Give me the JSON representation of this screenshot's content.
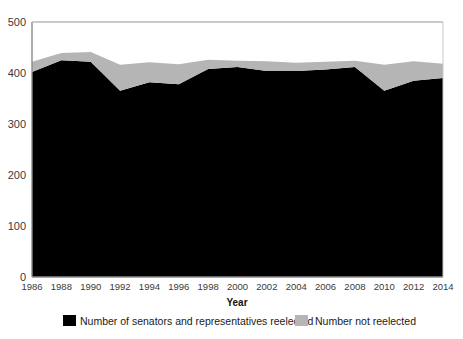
{
  "chart_data": {
    "type": "area",
    "stacked": true,
    "title": "",
    "xlabel": "Year",
    "ylabel": "",
    "categories": [
      1986,
      1988,
      1990,
      1992,
      1994,
      1996,
      1998,
      2000,
      2002,
      2004,
      2006,
      2008,
      2010,
      2012,
      2014
    ],
    "x": [
      1986,
      1988,
      1990,
      1992,
      1994,
      1996,
      1998,
      2000,
      2002,
      2004,
      2006,
      2008,
      2010,
      2012,
      2014
    ],
    "series": [
      {
        "name": "Number of senators and representatives reelected",
        "color": "#000000",
        "values": [
          402,
          425,
          422,
          365,
          382,
          378,
          408,
          412,
          404,
          404,
          407,
          412,
          365,
          385,
          390
        ]
      },
      {
        "name": "Number not reelected",
        "color": "#b5b5b5",
        "values": [
          20,
          14,
          19,
          51,
          39,
          39,
          18,
          12,
          19,
          16,
          15,
          12,
          51,
          38,
          28
        ]
      }
    ],
    "totals": [
      422,
      439,
      441,
      416,
      421,
      417,
      426,
      424,
      423,
      420,
      422,
      424,
      416,
      423,
      418
    ],
    "ylim": [
      0,
      500
    ],
    "yticks": [
      0,
      100,
      200,
      300,
      400,
      500
    ],
    "ytick_labels": [
      "0",
      "100",
      "200",
      "300",
      "400",
      "500"
    ],
    "xtick_labels": [
      "1986",
      "1988",
      "1990",
      "1992",
      "1994",
      "1996",
      "1998",
      "2000",
      "2002",
      "2004",
      "2006",
      "2008",
      "2010",
      "2012",
      "2014"
    ],
    "grid": true,
    "grid_color": "#9a9a9a",
    "plot_background": "#ffffff",
    "legend_position": "bottom"
  },
  "legend": {
    "items": [
      {
        "label": "Number of senators and representatives reelected",
        "swatch": "#000000"
      },
      {
        "label": "Number not reelected",
        "swatch": "#b5b5b5"
      }
    ]
  },
  "axis": {
    "x_title": "Year"
  }
}
